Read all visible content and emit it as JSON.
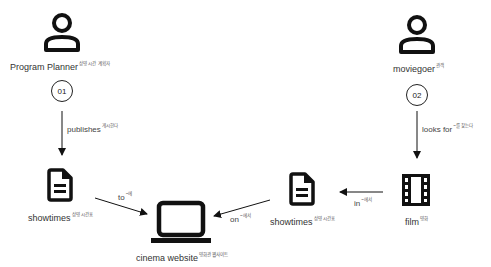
{
  "actors": [
    {
      "id": "program-planner",
      "label": "Program Planner",
      "sup": "상영 시간 계획자",
      "step": "01"
    },
    {
      "id": "moviegoer",
      "label": "moviegoer",
      "sup": "관객",
      "step": "02"
    }
  ],
  "nodes": {
    "showtimes_left": {
      "label": "showtimes",
      "sup": "상영 시간표"
    },
    "cinema_website": {
      "label": "cinema website",
      "sup": "영화관 웹사이트"
    },
    "showtimes_right": {
      "label": "showtimes",
      "sup": "상영 시간표"
    },
    "film": {
      "label": "film",
      "sup": "영화"
    }
  },
  "edges": {
    "publishes": {
      "label": "publishes",
      "sup": "게시한다"
    },
    "looks_for": {
      "label": "looks for",
      "sup": "~를 찾는다"
    },
    "to": {
      "label": "to",
      "sup": "~에"
    },
    "on": {
      "label": "on",
      "sup": "~에서"
    },
    "in": {
      "label": "in",
      "sup": "~에서"
    }
  }
}
